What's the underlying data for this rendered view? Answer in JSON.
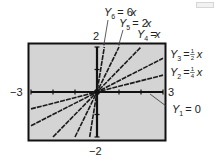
{
  "chart_data": {
    "type": "line",
    "title": "",
    "xlabel": "",
    "ylabel": "",
    "xlim": [
      -3,
      3
    ],
    "ylim": [
      -2,
      2
    ],
    "grid": false,
    "x_ticks": [
      -3,
      -2,
      -1,
      0,
      1,
      2,
      3
    ],
    "y_ticks": [
      -2,
      -1,
      0,
      1,
      2
    ],
    "axis_labels": {
      "x_min": "−3",
      "x_max": "3",
      "y_min": "−2",
      "y_max": "2"
    },
    "background": "#d4d4d4",
    "series": [
      {
        "name": "Y1 = 0",
        "slope": 0,
        "x": [
          -3,
          3
        ],
        "values": [
          0,
          0
        ]
      },
      {
        "name": "Y2 = 1/4 x",
        "slope": 0.25,
        "x": [
          -3,
          3
        ],
        "values": [
          -0.75,
          0.75
        ]
      },
      {
        "name": "Y3 = 1/2 x",
        "slope": 0.5,
        "x": [
          -3,
          3
        ],
        "values": [
          -1.5,
          1.5
        ]
      },
      {
        "name": "Y4 = x",
        "slope": 1,
        "x": [
          -2,
          2
        ],
        "values": [
          -2,
          2
        ]
      },
      {
        "name": "Y5 = 2x",
        "slope": 2,
        "x": [
          -1,
          1
        ],
        "values": [
          -2,
          2
        ]
      },
      {
        "name": "Y6 = 6x",
        "slope": 6,
        "x": [
          -0.3333,
          0.3333
        ],
        "values": [
          -2,
          2
        ]
      }
    ],
    "legend": {
      "position": "annotations",
      "entries": [
        {
          "var": "Y",
          "sub": "6",
          "eq": "= 6",
          "x": "x"
        },
        {
          "var": "Y",
          "sub": "5",
          "eq": "= 2",
          "x": "x"
        },
        {
          "var": "Y",
          "sub": "4",
          "eq": "=",
          "x": "x"
        },
        {
          "var": "Y",
          "sub": "3",
          "eq": "=",
          "num": "1",
          "den": "2",
          "x": "x"
        },
        {
          "var": "Y",
          "sub": "2",
          "eq": "=",
          "num": "1",
          "den": "4",
          "x": "x"
        },
        {
          "var": "Y",
          "sub": "1",
          "eq": "= 0"
        }
      ]
    }
  }
}
